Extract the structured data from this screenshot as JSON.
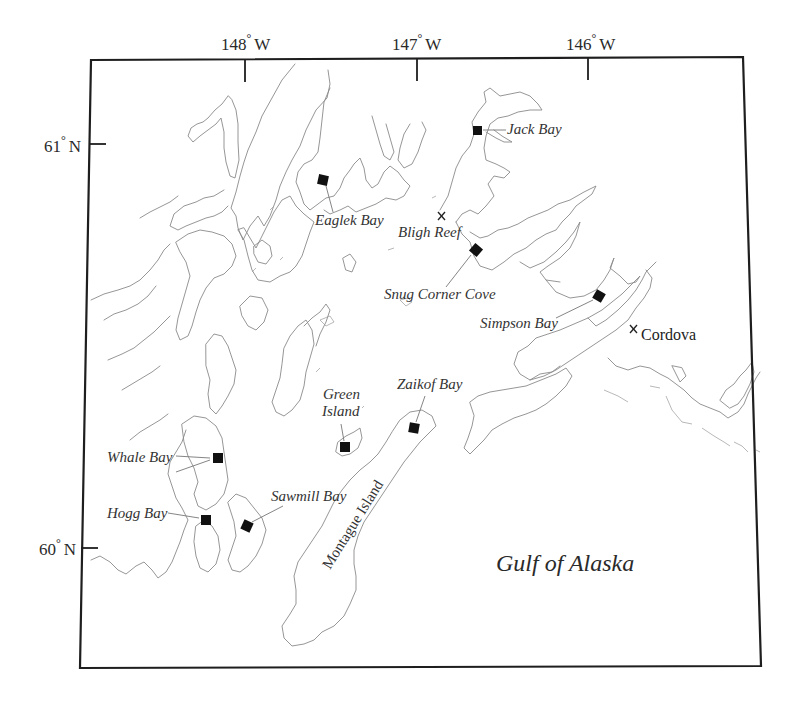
{
  "map": {
    "frame": {
      "tl": [
        91,
        60
      ],
      "tr": [
        743,
        57
      ],
      "br": [
        761,
        666
      ],
      "bl": [
        80,
        668
      ]
    },
    "longitude_ticks": [
      {
        "label": "148",
        "unit": "W",
        "x": 245,
        "label_x": 221
      },
      {
        "label": "147",
        "unit": "W",
        "x": 417,
        "label_x": 392
      },
      {
        "label": "146",
        "unit": "W",
        "x": 588,
        "label_x": 566
      }
    ],
    "latitude_ticks": [
      {
        "label": "61",
        "unit": "N",
        "y": 144
      },
      {
        "label": "60",
        "unit": "N",
        "y": 548
      }
    ],
    "degree_symbol": "°",
    "sampling_sites": [
      {
        "name": "Jack Bay",
        "marker": [
          477,
          130
        ],
        "label": [
          507,
          134
        ],
        "leader": [
          [
            483,
            130
          ],
          [
            505,
            130
          ]
        ]
      },
      {
        "name": "Eaglek Bay",
        "marker": [
          323,
          180
        ],
        "label": [
          315,
          225
        ],
        "leader": [
          [
            326,
            186
          ],
          [
            333,
            212
          ]
        ]
      },
      {
        "name": "Snug Corner Cove",
        "marker": [
          476,
          250
        ],
        "label": [
          384,
          299
        ],
        "leader": [
          [
            471,
            255
          ],
          [
            446,
            287
          ]
        ]
      },
      {
        "name": "Simpson Bay",
        "marker": [
          599,
          296
        ],
        "label": [
          480,
          328
        ],
        "leader": [
          [
            593,
            300
          ],
          [
            556,
            318
          ]
        ]
      },
      {
        "name": "Zaikof Bay",
        "marker": [
          414,
          428
        ],
        "label": [
          397,
          389
        ],
        "leader": [
          [
            416,
            422
          ],
          [
            425,
            396
          ]
        ]
      },
      {
        "name": "Green Island",
        "marker": [
          345,
          447
        ],
        "label_lines": [
          "Green",
          "Island"
        ],
        "label": [
          323,
          398
        ],
        "leader": [
          [
            344,
            441
          ],
          [
            341,
            423
          ]
        ]
      },
      {
        "name": "Whale Bay",
        "marker": [
          218,
          458
        ],
        "label": [
          107,
          462
        ],
        "leader": [
          [
            176,
            456
          ],
          [
            208,
            458
          ]
        ]
      },
      {
        "name": "Hogg Bay",
        "marker": [
          206,
          520
        ],
        "label": [
          107,
          518
        ],
        "leader": [
          [
            168,
            513
          ],
          [
            198,
            518
          ]
        ]
      },
      {
        "name": "Sawmill Bay",
        "marker": [
          247,
          526
        ],
        "label": [
          271,
          501
        ],
        "leader": [
          [
            252,
            522
          ],
          [
            283,
            505
          ]
        ]
      }
    ],
    "point_features": [
      {
        "name": "Bligh Reef",
        "x": 441,
        "y": 216,
        "label": [
          398,
          237
        ]
      },
      {
        "name": "Cordova",
        "x": 633,
        "y": 328,
        "label": [
          641,
          338
        ]
      }
    ],
    "island_label": {
      "name": "Montague Island",
      "x": 330,
      "y": 570,
      "rotate": -58
    },
    "sea_label": {
      "name": "Gulf of Alaska",
      "x": 496,
      "y": 571
    }
  }
}
